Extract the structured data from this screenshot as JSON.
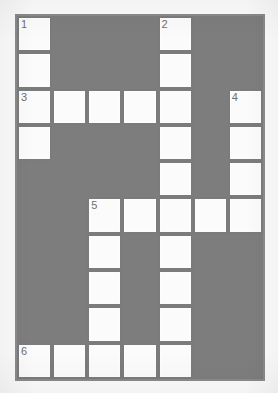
{
  "puzzle": {
    "title": "Crossword Grid",
    "columns": 7,
    "rows": 10,
    "colors": {
      "block_fill": "#7d7d7d",
      "open_fill": "#fbfbfb",
      "grid_line": "#7b7b7b",
      "number_text": "#6e6e6e",
      "page_background": "#fbfbfb"
    },
    "cells": [
      [
        {
          "type": "open",
          "number": "1"
        },
        {
          "type": "block",
          "number": ""
        },
        {
          "type": "block",
          "number": ""
        },
        {
          "type": "block",
          "number": ""
        },
        {
          "type": "open",
          "number": "2"
        },
        {
          "type": "block",
          "number": ""
        },
        {
          "type": "block",
          "number": ""
        }
      ],
      [
        {
          "type": "open",
          "number": ""
        },
        {
          "type": "block",
          "number": ""
        },
        {
          "type": "block",
          "number": ""
        },
        {
          "type": "block",
          "number": ""
        },
        {
          "type": "open",
          "number": ""
        },
        {
          "type": "block",
          "number": ""
        },
        {
          "type": "block",
          "number": ""
        }
      ],
      [
        {
          "type": "open",
          "number": "3"
        },
        {
          "type": "open",
          "number": ""
        },
        {
          "type": "open",
          "number": ""
        },
        {
          "type": "open",
          "number": ""
        },
        {
          "type": "open",
          "number": ""
        },
        {
          "type": "block",
          "number": ""
        },
        {
          "type": "open",
          "number": "4"
        }
      ],
      [
        {
          "type": "open",
          "number": ""
        },
        {
          "type": "block",
          "number": ""
        },
        {
          "type": "block",
          "number": ""
        },
        {
          "type": "block",
          "number": ""
        },
        {
          "type": "open",
          "number": ""
        },
        {
          "type": "block",
          "number": ""
        },
        {
          "type": "open",
          "number": ""
        }
      ],
      [
        {
          "type": "block",
          "number": ""
        },
        {
          "type": "block",
          "number": ""
        },
        {
          "type": "block",
          "number": ""
        },
        {
          "type": "block",
          "number": ""
        },
        {
          "type": "open",
          "number": ""
        },
        {
          "type": "block",
          "number": ""
        },
        {
          "type": "open",
          "number": ""
        }
      ],
      [
        {
          "type": "block",
          "number": ""
        },
        {
          "type": "block",
          "number": ""
        },
        {
          "type": "open",
          "number": "5"
        },
        {
          "type": "open",
          "number": ""
        },
        {
          "type": "open",
          "number": ""
        },
        {
          "type": "open",
          "number": ""
        },
        {
          "type": "open",
          "number": ""
        }
      ],
      [
        {
          "type": "block",
          "number": ""
        },
        {
          "type": "block",
          "number": ""
        },
        {
          "type": "open",
          "number": ""
        },
        {
          "type": "block",
          "number": ""
        },
        {
          "type": "open",
          "number": ""
        },
        {
          "type": "block",
          "number": ""
        },
        {
          "type": "block",
          "number": ""
        }
      ],
      [
        {
          "type": "block",
          "number": ""
        },
        {
          "type": "block",
          "number": ""
        },
        {
          "type": "open",
          "number": ""
        },
        {
          "type": "block",
          "number": ""
        },
        {
          "type": "open",
          "number": ""
        },
        {
          "type": "block",
          "number": ""
        },
        {
          "type": "block",
          "number": ""
        }
      ],
      [
        {
          "type": "block",
          "number": ""
        },
        {
          "type": "block",
          "number": ""
        },
        {
          "type": "open",
          "number": ""
        },
        {
          "type": "block",
          "number": ""
        },
        {
          "type": "open",
          "number": ""
        },
        {
          "type": "block",
          "number": ""
        },
        {
          "type": "block",
          "number": ""
        }
      ],
      [
        {
          "type": "open",
          "number": "6"
        },
        {
          "type": "open",
          "number": ""
        },
        {
          "type": "open",
          "number": ""
        },
        {
          "type": "open",
          "number": ""
        },
        {
          "type": "open",
          "number": ""
        },
        {
          "type": "block",
          "number": ""
        },
        {
          "type": "block",
          "number": ""
        }
      ]
    ],
    "clue_numbers": [
      "1",
      "2",
      "3",
      "4",
      "5",
      "6"
    ]
  }
}
